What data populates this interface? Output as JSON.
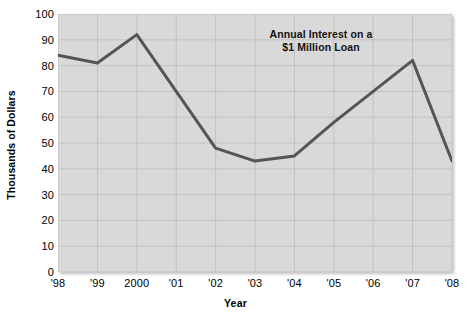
{
  "chart_data": {
    "type": "line",
    "title": "Annual Interest on a $1 Million Loan",
    "title_line1": "Annual Interest on a",
    "title_line2": "$1 Million Loan",
    "xlabel": "Year",
    "ylabel": "Thousands of Dollars",
    "categories": [
      "'98",
      "'99",
      "2000",
      "'01",
      "'02",
      "'03",
      "'04",
      "'05",
      "'06",
      "'07",
      "'08"
    ],
    "values": [
      84,
      81,
      92,
      70,
      48,
      43,
      45,
      58,
      70,
      82,
      43
    ],
    "xlim": [
      0,
      10
    ],
    "ylim": [
      0,
      100
    ],
    "yticks": [
      0,
      10,
      20,
      30,
      40,
      50,
      60,
      70,
      80,
      90,
      100
    ],
    "ytick_labels": [
      "0",
      "10",
      "20",
      "30",
      "40",
      "50",
      "60",
      "70",
      "80",
      "90",
      "100"
    ],
    "grid": true,
    "legend": "none",
    "series_color": "#555555",
    "plot_bg_color": "#d9d9d9",
    "grid_color": "#c2c2c2"
  }
}
